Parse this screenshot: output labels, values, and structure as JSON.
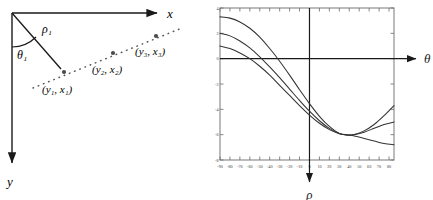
{
  "figure": {
    "type": "hough-transform-illustration",
    "panels": [
      "image-space-diagram",
      "parameter-space-plot"
    ]
  },
  "left_diagram": {
    "name": "image-space-diagram",
    "axes": {
      "x_label": "x",
      "y_label": "y",
      "origin_label": "",
      "x_axis_direction": "right",
      "y_axis_direction": "down"
    },
    "annotations": {
      "rho_label": "ρ₁",
      "theta_label": "θ₁"
    },
    "points": [
      {
        "label": "(y₁, x₁)",
        "cx": 64,
        "cy": 72
      },
      {
        "label": "(y₂, x₂)",
        "cx": 113,
        "cy": 53
      },
      {
        "label": "(y₃, x₃)",
        "cx": 156,
        "cy": 36
      }
    ],
    "colors": {
      "axis": "#1a1a1a",
      "line": "#1a1a1a",
      "point": "#4a4a4a",
      "dotted": "#555555"
    }
  },
  "chart_data": {
    "type": "line",
    "title": "",
    "xlabel": "ρ",
    "ylabel": "θ",
    "axis_note": "θ arrow points right along horizontal axis; ρ arrow points down below the vertical axis",
    "xlim": [
      -90,
      85
    ],
    "ylim": [
      -8,
      4
    ],
    "xticks": [
      -90,
      -80,
      -70,
      -60,
      -50,
      -40,
      -30,
      -20,
      -10,
      0,
      10,
      20,
      30,
      40,
      50,
      60,
      70,
      80
    ],
    "xticklabels": [
      "-90",
      "-80",
      "-70",
      "-60",
      "-50",
      "-40",
      "-30",
      "-20",
      "-10",
      "0",
      "10",
      "20",
      "30",
      "40",
      "50",
      "60",
      "70",
      "80"
    ],
    "yticks": [
      4,
      2,
      0,
      -2,
      -4,
      -6,
      -8
    ],
    "yticklabels": [
      "4",
      "2",
      "0",
      "-2",
      "-4",
      "-6",
      "-8"
    ],
    "grid": false,
    "legend": false,
    "intersection": {
      "x": 38,
      "y": -6.0
    },
    "series": [
      {
        "name": "curve-point-1",
        "values": [
          [
            -90,
            1.0
          ],
          [
            -80,
            0.8
          ],
          [
            -70,
            0.45
          ],
          [
            -60,
            0.0
          ],
          [
            -50,
            -0.6
          ],
          [
            -40,
            -1.3
          ],
          [
            -30,
            -2.1
          ],
          [
            -20,
            -2.9
          ],
          [
            -10,
            -3.7
          ],
          [
            0,
            -4.45
          ],
          [
            10,
            -5.1
          ],
          [
            20,
            -5.6
          ],
          [
            30,
            -5.92
          ],
          [
            38,
            -6.02
          ],
          [
            45,
            -5.98
          ],
          [
            55,
            -5.7
          ],
          [
            65,
            -5.2
          ],
          [
            75,
            -4.5
          ],
          [
            85,
            -3.7
          ]
        ]
      },
      {
        "name": "curve-point-2",
        "values": [
          [
            -90,
            2.0
          ],
          [
            -80,
            1.8
          ],
          [
            -70,
            1.4
          ],
          [
            -60,
            0.85
          ],
          [
            -50,
            0.15
          ],
          [
            -40,
            -0.65
          ],
          [
            -30,
            -1.5
          ],
          [
            -20,
            -2.4
          ],
          [
            -10,
            -3.3
          ],
          [
            0,
            -4.15
          ],
          [
            10,
            -4.9
          ],
          [
            20,
            -5.5
          ],
          [
            30,
            -5.9
          ],
          [
            38,
            -6.02
          ],
          [
            45,
            -6.1
          ],
          [
            55,
            -6.3
          ],
          [
            65,
            -6.5
          ],
          [
            75,
            -6.7
          ],
          [
            85,
            -6.8
          ]
        ]
      },
      {
        "name": "curve-point-3",
        "values": [
          [
            -90,
            3.3
          ],
          [
            -80,
            3.2
          ],
          [
            -70,
            2.9
          ],
          [
            -60,
            2.4
          ],
          [
            -50,
            1.7
          ],
          [
            -40,
            0.8
          ],
          [
            -30,
            -0.2
          ],
          [
            -20,
            -1.3
          ],
          [
            -10,
            -2.45
          ],
          [
            0,
            -3.55
          ],
          [
            10,
            -4.55
          ],
          [
            20,
            -5.35
          ],
          [
            30,
            -5.9
          ],
          [
            38,
            -6.02
          ],
          [
            45,
            -6.0
          ],
          [
            55,
            -5.8
          ],
          [
            65,
            -5.5
          ],
          [
            75,
            -5.2
          ],
          [
            85,
            -5.0
          ]
        ]
      }
    ],
    "colors": {
      "curve": "#333333",
      "axis": "#1a1a1a",
      "frame": "#6a6a6a",
      "tick_label": "#3a3a3a"
    }
  }
}
